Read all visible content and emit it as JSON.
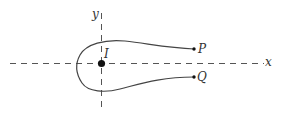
{
  "diagram": {
    "axes": {
      "x_label": "x",
      "y_label": "y",
      "style": "dashed"
    },
    "points": {
      "center": {
        "label": "I"
      },
      "upper_end": {
        "label": "P"
      },
      "lower_end": {
        "label": "Q"
      }
    },
    "colors": {
      "axis": "#555555",
      "curve": "#444444",
      "point": "#111111"
    }
  }
}
